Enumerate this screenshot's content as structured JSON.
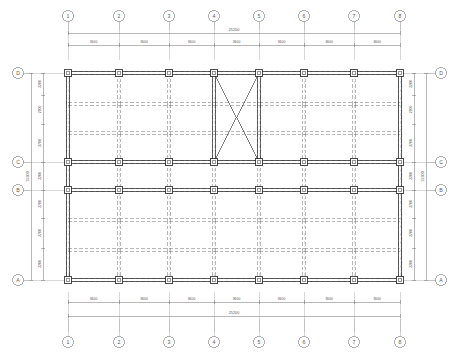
{
  "drawing": {
    "type": "structural-framing-plan",
    "units": "mm"
  },
  "grid": {
    "vertical_labels": [
      "1",
      "2",
      "3",
      "4",
      "5",
      "6",
      "7",
      "8"
    ],
    "horizontal_labels": [
      "A",
      "B",
      "C",
      "D"
    ]
  },
  "dimensions": {
    "top_chain": [
      "3600",
      "3600",
      "3600",
      "3600",
      "3600",
      "3600",
      "3600"
    ],
    "top_overall": "25200",
    "bottom_chain": [
      "3600",
      "3600",
      "3600",
      "3600",
      "3600",
      "3600",
      "3600"
    ],
    "bottom_overall": "25200",
    "left_chain": [
      "2200",
      "2700",
      "2700",
      "2200",
      "2700",
      "2700",
      "2200"
    ],
    "left_overall": "15900",
    "right_chain": [
      "2200",
      "2700",
      "2700",
      "2200",
      "2700",
      "2700",
      "2200"
    ],
    "right_overall": "15900"
  },
  "geometry": {
    "x_positions": [
      68,
      119,
      169,
      214,
      259,
      304,
      354,
      400
    ],
    "y_positions_letters": {
      "D": 73,
      "C": 162,
      "B": 190,
      "A": 280
    },
    "y_beam_rows": [
      73,
      104,
      133,
      162,
      190,
      220,
      250,
      280
    ],
    "x_brace_bay": {
      "from_grid": "4",
      "to_grid": "5",
      "from_letter": "C",
      "to_letter": "D"
    }
  },
  "colors": {
    "line_dark": "#2b2b2b",
    "line_mid": "#6f6f6f",
    "line_light": "#a8a8a8",
    "dim_text": "#555555",
    "background": "#ffffff"
  },
  "legend": {
    "column": "column",
    "main_beam": "main-beam",
    "secondary_beam": "secondary-beam",
    "brace": "cross-brace"
  }
}
